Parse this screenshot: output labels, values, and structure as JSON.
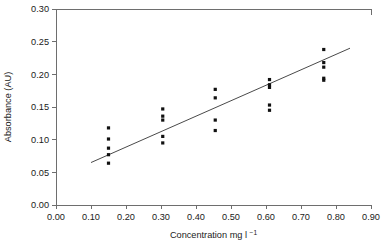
{
  "chart_data": {
    "type": "scatter",
    "title": "",
    "xlabel": "Concentration mg l",
    "xlabel_sup": "−1",
    "ylabel": "Absorbance (AU)",
    "xlim": [
      0.0,
      0.9
    ],
    "ylim": [
      0.0,
      0.3
    ],
    "xticks": [
      0.0,
      0.1,
      0.2,
      0.3,
      0.4,
      0.5,
      0.6,
      0.7,
      0.8,
      0.9
    ],
    "yticks": [
      0.0,
      0.05,
      0.1,
      0.15,
      0.2,
      0.25,
      0.3
    ],
    "xtick_labels": [
      "0.00",
      "0.10",
      "0.20",
      "0.30",
      "0.40",
      "0.50",
      "0.60",
      "0.70",
      "0.80",
      "0.90"
    ],
    "ytick_labels": [
      "0.00",
      "0.05",
      "0.10",
      "0.15",
      "0.20",
      "0.25",
      "0.30"
    ],
    "grid": false,
    "legend": false,
    "marker": "square",
    "marker_color": "#111111",
    "line_color": "#4a4a4a",
    "frame_color": "#6e6e6e",
    "x": [
      0.15,
      0.15,
      0.15,
      0.15,
      0.15,
      0.305,
      0.305,
      0.305,
      0.305,
      0.305,
      0.455,
      0.455,
      0.455,
      0.455,
      0.61,
      0.61,
      0.61,
      0.61,
      0.61,
      0.765,
      0.765,
      0.765,
      0.765,
      0.765
    ],
    "y": [
      0.064,
      0.077,
      0.087,
      0.101,
      0.118,
      0.095,
      0.105,
      0.13,
      0.136,
      0.147,
      0.114,
      0.13,
      0.164,
      0.177,
      0.145,
      0.153,
      0.18,
      0.184,
      0.192,
      0.191,
      0.194,
      0.211,
      0.218,
      0.238
    ],
    "groups": [
      {
        "concentration": 0.15,
        "absorbances": [
          0.064,
          0.077,
          0.087,
          0.101,
          0.118
        ]
      },
      {
        "concentration": 0.305,
        "absorbances": [
          0.095,
          0.105,
          0.13,
          0.136,
          0.147
        ]
      },
      {
        "concentration": 0.455,
        "absorbances": [
          0.114,
          0.13,
          0.164,
          0.177
        ]
      },
      {
        "concentration": 0.61,
        "absorbances": [
          0.145,
          0.153,
          0.18,
          0.184,
          0.192
        ]
      },
      {
        "concentration": 0.765,
        "absorbances": [
          0.191,
          0.194,
          0.211,
          0.218,
          0.238
        ]
      }
    ],
    "fit_line": {
      "x_start": 0.1,
      "y_start": 0.065,
      "x_end": 0.84,
      "y_end": 0.24,
      "slope": 0.2365,
      "intercept": 0.0414
    }
  }
}
